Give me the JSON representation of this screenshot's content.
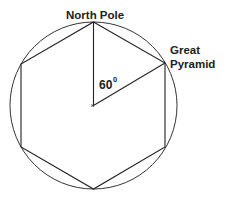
{
  "diagram": {
    "labels": {
      "top": "North Pole",
      "right_line1": "Great",
      "right_line2": "Pyramid",
      "angle": "60",
      "angle_unit": "0"
    },
    "circle": {
      "cx": 93.5,
      "cy": 105.5,
      "r": 83.5,
      "stroke": "#333333"
    },
    "hexagon_vertices": [
      [
        93.5,
        22
      ],
      [
        165,
        63
      ],
      [
        165,
        147
      ],
      [
        93.5,
        189
      ],
      [
        21,
        147
      ],
      [
        21,
        64
      ]
    ],
    "center_mark": "×"
  }
}
